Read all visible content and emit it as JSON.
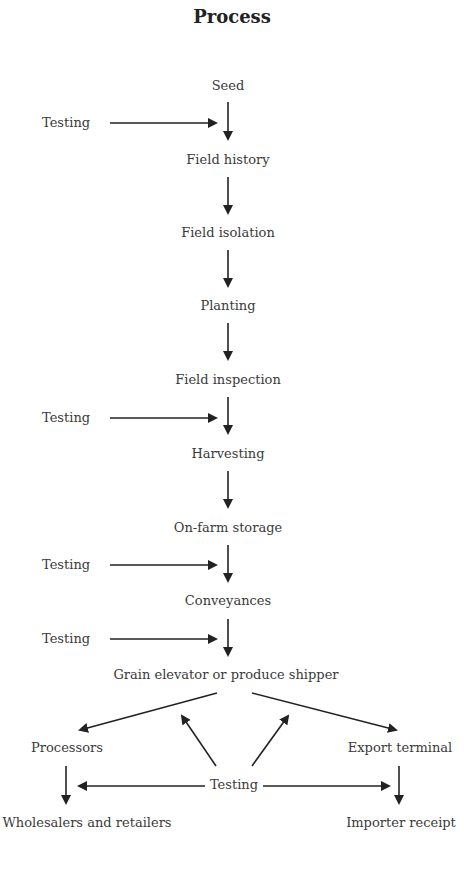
{
  "title": "Process",
  "steps": [
    {
      "label": "Seed"
    },
    {
      "label": "Field history"
    },
    {
      "label": "Field isolation"
    },
    {
      "label": "Planting"
    },
    {
      "label": "Field inspection"
    },
    {
      "label": "Harvesting"
    },
    {
      "label": "On-farm storage"
    },
    {
      "label": "Conveyances"
    },
    {
      "label": "Grain elevator or produce shipper"
    }
  ],
  "testing_labels": [
    "Testing",
    "Testing",
    "Testing",
    "Testing"
  ],
  "branches": {
    "left": {
      "label": "Processors",
      "destination": "Wholesalers and retailers"
    },
    "right": {
      "label": "Export terminal",
      "destination": "Importer receipt"
    },
    "bottom_testing": "Testing"
  }
}
